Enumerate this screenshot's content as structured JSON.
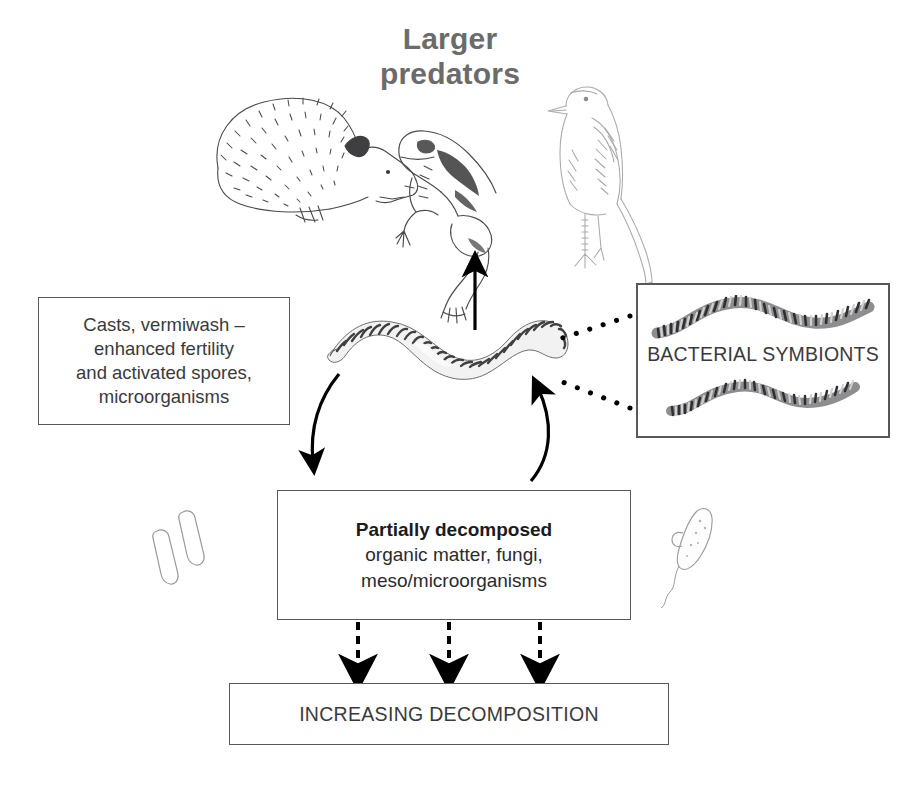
{
  "figure": {
    "title_lines": [
      "Larger",
      "predators"
    ],
    "title_color": "#6b6b6b"
  },
  "predators": [
    {
      "name": "hedgehog",
      "icon": "hedgehog-illustration"
    },
    {
      "name": "frog",
      "icon": "frog-illustration"
    },
    {
      "name": "bird",
      "icon": "bird-illustration"
    }
  ],
  "center_organism": {
    "name": "earthworm",
    "icon": "earthworm-illustration"
  },
  "boxes": {
    "casts": {
      "lines": [
        "Casts, vermiwash –",
        "enhanced fertility",
        "and activated spores,",
        "microorganisms"
      ]
    },
    "partially_decomposed": {
      "heading": "Partially decomposed",
      "lines": [
        "organic matter, fungi,",
        "meso/microorganisms"
      ]
    },
    "increasing_decomposition": {
      "label": "INCREASING DECOMPOSITION"
    },
    "bacterial_symbionts": {
      "label": "BACTERIAL SYMBIONTS"
    }
  },
  "side_organisms": [
    {
      "name": "rod-bacteria",
      "icon": "rod-bacteria-illustration",
      "position": "left"
    },
    {
      "name": "flagellate-protozoan",
      "icon": "flagellate-protozoan-illustration",
      "position": "right"
    }
  ],
  "arrows": [
    {
      "name": "worm-to-predators",
      "style": "solid",
      "direction": "up"
    },
    {
      "name": "worm-to-decomposed",
      "style": "curved-solid",
      "direction": "down-left"
    },
    {
      "name": "decomposed-to-worm",
      "style": "curved-solid",
      "direction": "up-right"
    },
    {
      "name": "decomposed-to-increasing-1",
      "style": "dashed",
      "direction": "down"
    },
    {
      "name": "decomposed-to-increasing-2",
      "style": "dashed",
      "direction": "down"
    },
    {
      "name": "decomposed-to-increasing-3",
      "style": "dashed",
      "direction": "down"
    },
    {
      "name": "symbionts-to-worm-upper",
      "style": "dotted",
      "direction": "left"
    },
    {
      "name": "symbionts-to-worm-lower",
      "style": "dotted",
      "direction": "left"
    }
  ],
  "colors": {
    "box_stroke": "#58585a",
    "arrow": "#000000",
    "text": "#3a3a3c",
    "title": "#6b6b6b"
  }
}
